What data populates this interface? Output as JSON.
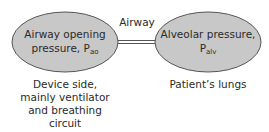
{
  "diagram": {
    "colors": {
      "ellipse_fill": "#c8c8c8",
      "ellipse_stroke": "#555555",
      "connector": "#555555",
      "text": "#2a2a2a"
    },
    "nodes": [
      {
        "id": "airway-opening-pressure",
        "line1": "Airway opening",
        "line2_main": "pressure, P",
        "line2_sub": "ao",
        "caption_lines": [
          "Device side,",
          "mainly ventilator",
          "and breathing",
          "circuit"
        ]
      },
      {
        "id": "alveolar-pressure",
        "line1": "Alveolar pressure,",
        "line2_main": "P",
        "line2_sub": "alv",
        "caption_lines": [
          "Patient’s lungs"
        ]
      }
    ],
    "connector": {
      "label": "Airway",
      "from": "airway-opening-pressure",
      "to": "alveolar-pressure",
      "style": "double-line"
    }
  }
}
